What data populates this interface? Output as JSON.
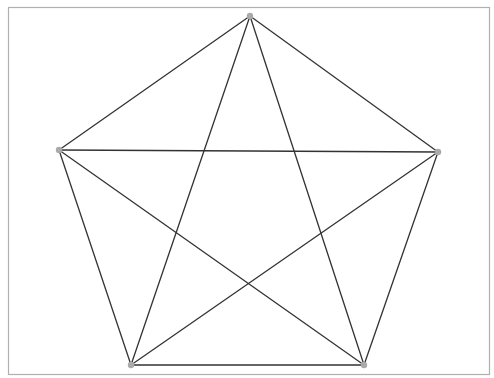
{
  "diagram": {
    "type": "complete-graph",
    "name": "K5",
    "frame": {
      "x": 8,
      "y": 7,
      "width": 481,
      "height": 367,
      "stroke": "#b0b0b0"
    },
    "style": {
      "edge_color": "#333333",
      "edge_width": 1.3,
      "node_color": "#aaaaaa",
      "node_radius": 3.2
    },
    "nodes": [
      {
        "id": "top",
        "x": 250,
        "y": 16
      },
      {
        "id": "left",
        "x": 59,
        "y": 150
      },
      {
        "id": "right",
        "x": 438,
        "y": 152
      },
      {
        "id": "bottom-left",
        "x": 131,
        "y": 365
      },
      {
        "id": "bottom-right",
        "x": 364,
        "y": 365
      }
    ],
    "edges": [
      [
        "top",
        "left"
      ],
      [
        "top",
        "right"
      ],
      [
        "top",
        "bottom-left"
      ],
      [
        "top",
        "bottom-right"
      ],
      [
        "left",
        "right"
      ],
      [
        "left",
        "bottom-left"
      ],
      [
        "left",
        "bottom-right"
      ],
      [
        "right",
        "bottom-left"
      ],
      [
        "right",
        "bottom-right"
      ],
      [
        "bottom-left",
        "bottom-right"
      ]
    ]
  }
}
